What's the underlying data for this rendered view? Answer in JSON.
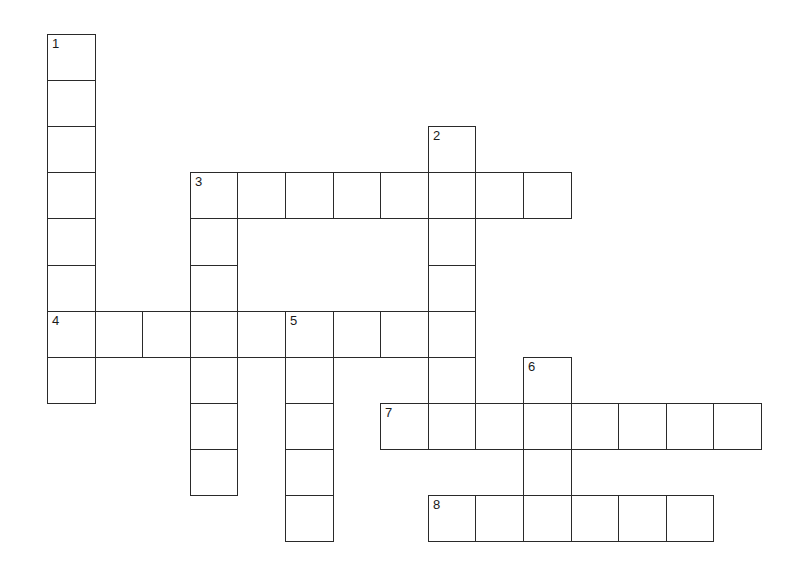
{
  "puzzle": {
    "type": "crossword",
    "grid": {
      "origin_x": 47,
      "origin_y": 34,
      "cell_w": 47.6,
      "cell_h": 46.1,
      "border_color": "#2a2a2a"
    },
    "entries": [
      {
        "number": "1",
        "direction": "down",
        "col": 0,
        "row": 0,
        "length": 8
      },
      {
        "number": "2",
        "direction": "down",
        "col": 8,
        "row": 2,
        "length": 7
      },
      {
        "number": "3",
        "direction": "across",
        "col": 3,
        "row": 3,
        "length": 8
      },
      {
        "number": "3",
        "direction": "down",
        "col": 3,
        "row": 3,
        "length": 7
      },
      {
        "number": "4",
        "direction": "across",
        "col": 0,
        "row": 6,
        "length": 8
      },
      {
        "number": "5",
        "direction": "down",
        "col": 5,
        "row": 6,
        "length": 5
      },
      {
        "number": "6",
        "direction": "down",
        "col": 10,
        "row": 7,
        "length": 4
      },
      {
        "number": "7",
        "direction": "across",
        "col": 7,
        "row": 8,
        "length": 8
      },
      {
        "number": "8",
        "direction": "across",
        "col": 8,
        "row": 10,
        "length": 6
      }
    ],
    "numbered_cells": [
      {
        "label": "1",
        "col": 0,
        "row": 0
      },
      {
        "label": "2",
        "col": 8,
        "row": 2
      },
      {
        "label": "3",
        "col": 3,
        "row": 3
      },
      {
        "label": "4",
        "col": 0,
        "row": 6
      },
      {
        "label": "5",
        "col": 5,
        "row": 6
      },
      {
        "label": "6",
        "col": 10,
        "row": 7
      },
      {
        "label": "7",
        "col": 7,
        "row": 8
      },
      {
        "label": "8",
        "col": 8,
        "row": 10
      }
    ]
  }
}
